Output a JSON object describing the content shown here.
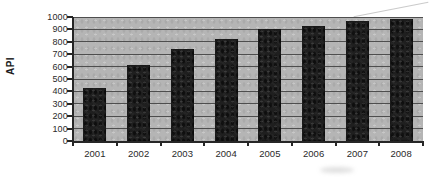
{
  "chart_data": {
    "type": "bar",
    "title": "",
    "xlabel": "",
    "ylabel": "API",
    "categories": [
      "2001",
      "2002",
      "2003",
      "2004",
      "2005",
      "2006",
      "2007",
      "2008"
    ],
    "values": [
      430,
      610,
      740,
      820,
      900,
      930,
      965,
      980
    ],
    "ylim": [
      0,
      1000
    ],
    "ytick_step": 100,
    "yticks": [
      0,
      100,
      200,
      300,
      400,
      500,
      600,
      700,
      800,
      900,
      1000
    ],
    "grid": "horizontal",
    "legend": "none",
    "colors": {
      "plot_background": "#b5b5b5",
      "bar": "#1f1f1f",
      "gridline": "#4e4e4e",
      "axis": "#262626",
      "text": "#2a2a2a",
      "page_background": "#ffffff"
    }
  }
}
